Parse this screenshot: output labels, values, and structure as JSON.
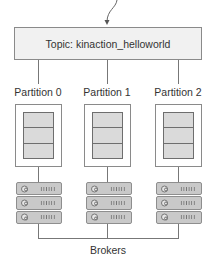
{
  "topic": {
    "label": "Topic: kinaction_helloworld"
  },
  "partitions": [
    {
      "label": "Partition 0",
      "segments": 3
    },
    {
      "label": "Partition 1",
      "segments": 3
    },
    {
      "label": "Partition 2",
      "segments": 3
    }
  ],
  "brokers": {
    "label": "Brokers",
    "stacks": [
      {
        "servers": 3
      },
      {
        "servers": 3
      },
      {
        "servers": 3
      }
    ]
  },
  "colors": {
    "border": "#8a8a8a",
    "line": "#777777",
    "topic_fill": "#f1f1f1",
    "segment_fill": "#dadada",
    "server_fill": "#c9c9c9",
    "text": "#333333"
  },
  "icons": {
    "incoming_arrow": "arrow-down-curved-icon",
    "server": "server-rack-icon"
  }
}
